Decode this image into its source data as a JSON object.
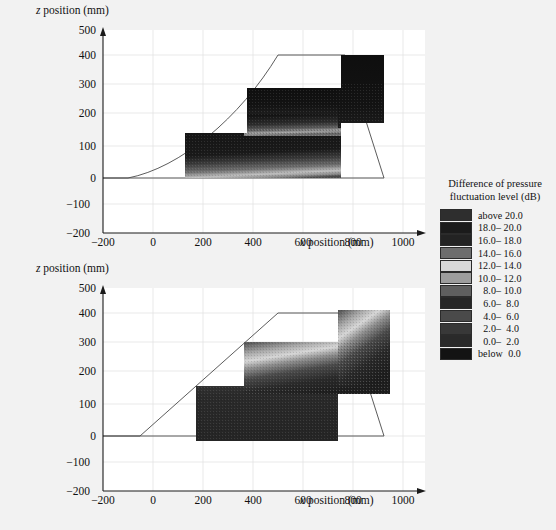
{
  "figure": {
    "background": "#f2f2f2",
    "panel_background": "#ffffff"
  },
  "chart_data": {
    "type": "heatmap",
    "title": "",
    "xlabel": "x position (mm)",
    "ylabel": "z position (mm)",
    "xlim": [
      -200,
      1100
    ],
    "ylim": [
      -200,
      500
    ],
    "xticks": [
      -200,
      0,
      200,
      400,
      600,
      800,
      1000
    ],
    "yticks": [
      -200,
      -100,
      0,
      100,
      200,
      300,
      400,
      500
    ],
    "grid": true,
    "units": "mm",
    "colorbar": {
      "title_line1": "Difference of pressure",
      "title_line2": "fluctuation level (dB)",
      "units": "dB",
      "entries": [
        {
          "label": "above 20.0",
          "range_low": 20.0,
          "range_high": null,
          "color": "#2e2e2e"
        },
        {
          "label": "18.0– 20.0",
          "range_low": 18.0,
          "range_high": 20.0,
          "color": "#1b1b1b"
        },
        {
          "label": "16.0– 18.0",
          "range_low": 16.0,
          "range_high": 18.0,
          "color": "#232323"
        },
        {
          "label": "14.0– 16.0",
          "range_low": 14.0,
          "range_high": 16.0,
          "color": "#6d6d6d"
        },
        {
          "label": "12.0– 14.0",
          "range_low": 12.0,
          "range_high": 14.0,
          "color": "#d8d8d8"
        },
        {
          "label": "10.0– 12.0",
          "range_low": 10.0,
          "range_high": 12.0,
          "color": "#9d9d9d"
        },
        {
          "label": "  8.0– 10.0",
          "range_low": 8.0,
          "range_high": 10.0,
          "color": "#5f5f5f"
        },
        {
          "label": "  6.0–  8.0",
          "range_low": 6.0,
          "range_high": 8.0,
          "color": "#262626"
        },
        {
          "label": "  4.0–  6.0",
          "range_low": 4.0,
          "range_high": 6.0,
          "color": "#4a4a4a"
        },
        {
          "label": "  2.0–  4.0",
          "range_low": 2.0,
          "range_high": 4.0,
          "color": "#383838"
        },
        {
          "label": "  0.0–  2.0",
          "range_low": 0.0,
          "range_high": 2.0,
          "color": "#2a2a2a"
        },
        {
          "label": "below  0.0",
          "range_low": null,
          "range_high": 0.0,
          "color": "#131313"
        }
      ]
    },
    "panels": [
      {
        "name": "upper-panel",
        "xlabel": "x position (mm)",
        "ylabel": "z position (mm)",
        "outline_note": "curved leading edge",
        "outline_points": [
          [
            -200,
            -25
          ],
          [
            100,
            -25
          ],
          [
            600,
            410
          ],
          [
            960,
            410
          ],
          [
            800,
            -25
          ]
        ],
        "steps": [
          {
            "x0": 215,
            "x1": 300,
            "z_top": 80,
            "z_bottom": -25
          },
          {
            "x0": 300,
            "x1": 490,
            "z_top": 205,
            "z_bottom": -25
          },
          {
            "x0": 490,
            "x1": 775,
            "z_top": 320,
            "z_bottom": -25
          },
          {
            "x0": 775,
            "x1": 905,
            "z_top": 400,
            "z_bottom": 160
          }
        ],
        "field_description": "dark (high level) over most of the stepped surface, with a lighter gradient band near the lower edge around z = 0 to 60 mm"
      },
      {
        "name": "lower-panel",
        "xlabel": "x position (mm)",
        "ylabel": "z position (mm)",
        "outline_note": "straight leading edge",
        "outline_points": [
          [
            -200,
            -25
          ],
          [
            150,
            -25
          ],
          [
            600,
            410
          ],
          [
            960,
            410
          ],
          [
            800,
            -25
          ]
        ],
        "steps": [
          {
            "x0": 215,
            "x1": 300,
            "z_top": 80,
            "z_bottom": -25
          },
          {
            "x0": 300,
            "x1": 490,
            "z_top": 205,
            "z_bottom": -25
          },
          {
            "x0": 490,
            "x1": 775,
            "z_top": 320,
            "z_bottom": -25
          },
          {
            "x0": 775,
            "x1": 905,
            "z_top": 400,
            "z_bottom": 160
          }
        ],
        "field_description": "dark (high level) below a bright diagonal band that rises from about (300, 150) to (900, 370)"
      }
    ]
  }
}
